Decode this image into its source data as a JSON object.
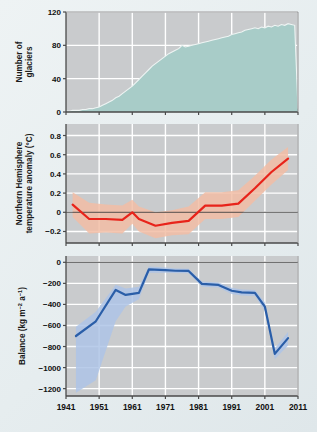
{
  "figure": {
    "background_color": "#e9eff1",
    "panel_color": "#c9cbcd",
    "grid_color": "#ffffff",
    "axis_color": "#4a4a4a"
  },
  "chart_data": [
    {
      "type": "area",
      "panel": "top",
      "title": "",
      "xlabel": "",
      "ylabel": "Number of glaciers",
      "ylabel_lines": [
        "Number of",
        "glaciers"
      ],
      "series_name": "Number of glaciers",
      "color": "#a8ccc8",
      "line_color": "#eef4f3",
      "xlim": [
        1941,
        2011
      ],
      "ylim": [
        0,
        120
      ],
      "yticks": [
        0,
        40,
        80,
        120
      ],
      "ytick_labels": [
        "0",
        "40",
        "80",
        "120"
      ],
      "xticks": [
        1941,
        1951,
        1961,
        1971,
        1981,
        1991,
        2001,
        2011
      ],
      "grid": true,
      "x": [
        1941,
        1942,
        1943,
        1944,
        1945,
        1946,
        1947,
        1948,
        1949,
        1950,
        1951,
        1952,
        1953,
        1954,
        1955,
        1956,
        1957,
        1958,
        1959,
        1960,
        1961,
        1962,
        1963,
        1964,
        1965,
        1966,
        1967,
        1968,
        1969,
        1970,
        1971,
        1972,
        1973,
        1974,
        1975,
        1976,
        1977,
        1978,
        1979,
        1980,
        1981,
        1982,
        1983,
        1984,
        1985,
        1986,
        1987,
        1988,
        1989,
        1990,
        1991,
        1992,
        1993,
        1994,
        1995,
        1996,
        1997,
        1998,
        1999,
        2000,
        2001,
        2002,
        2003,
        2004,
        2005,
        2006,
        2007,
        2008,
        2009,
        2010,
        2011
      ],
      "values": [
        1,
        1,
        2,
        2,
        2,
        3,
        3,
        4,
        4,
        5,
        6,
        8,
        10,
        12,
        14,
        17,
        19,
        22,
        25,
        28,
        31,
        35,
        39,
        43,
        47,
        51,
        55,
        58,
        61,
        64,
        67,
        70,
        72,
        74,
        76,
        80,
        78,
        79,
        80,
        81,
        82,
        83,
        84,
        85,
        86,
        87,
        88,
        89,
        90,
        91,
        93,
        94,
        95,
        96,
        98,
        99,
        100,
        101,
        100,
        102,
        101,
        103,
        102,
        104,
        103,
        105,
        104,
        106,
        105,
        104,
        4
      ]
    },
    {
      "type": "line",
      "panel": "middle",
      "title": "",
      "xlabel": "",
      "ylabel": "Northern Hemisphere temperature anomaly (°C)",
      "ylabel_lines": [
        "Northern Hemisphere",
        "temperature anomaly (°C)"
      ],
      "series_name": "Northern Hemisphere temperature anomaly",
      "color": "#e8231a",
      "band_color": "#f2bda4",
      "band_label": "uncertainty range",
      "units": "°C",
      "xlim": [
        1941,
        2011
      ],
      "ylim": [
        -0.32,
        0.92
      ],
      "yticks": [
        -0.2,
        0,
        0.2,
        0.4,
        0.6,
        0.8
      ],
      "ytick_labels": [
        "−0.2",
        "0",
        "0.2",
        "0.4",
        "0.6",
        "0.8"
      ],
      "xticks": [
        1941,
        1951,
        1961,
        1971,
        1981,
        1991,
        2001,
        2011
      ],
      "grid": true,
      "zero_line": 0,
      "x": [
        1943,
        1948,
        1953,
        1958,
        1961,
        1963,
        1968,
        1973,
        1978,
        1983,
        1988,
        1993,
        1998,
        2003,
        2008
      ],
      "values": [
        0.08,
        -0.07,
        -0.07,
        -0.08,
        0.0,
        -0.07,
        -0.14,
        -0.11,
        -0.09,
        0.07,
        0.07,
        0.09,
        0.25,
        0.42,
        0.56
      ],
      "band_upper": [
        0.21,
        0.1,
        0.08,
        0.07,
        0.13,
        0.06,
        0.0,
        0.02,
        0.06,
        0.21,
        0.21,
        0.23,
        0.38,
        0.55,
        0.68
      ],
      "band_lower": [
        -0.05,
        -0.22,
        -0.21,
        -0.22,
        -0.12,
        -0.2,
        -0.27,
        -0.24,
        -0.23,
        -0.07,
        -0.07,
        -0.05,
        0.12,
        0.29,
        0.44
      ]
    },
    {
      "type": "line",
      "panel": "bottom",
      "title": "",
      "xlabel": "",
      "ylabel": "Balance (kg m−2 a−1)",
      "ylabel_parts": [
        "Balance (kg m",
        "−2",
        " a",
        "−1",
        ")"
      ],
      "series_name": "Glacier mass balance",
      "color": "#2a5ea8",
      "band_color": "#aec4e6",
      "band_label": "uncertainty range",
      "units": "kg m−2 a−1",
      "xlim": [
        1941,
        2011
      ],
      "ylim": [
        -1270,
        60
      ],
      "yticks": [
        0,
        -200,
        -400,
        -600,
        -800,
        -1000,
        -1200
      ],
      "ytick_labels": [
        "0",
        "−200",
        "−400",
        "−600",
        "−800",
        "−1000",
        "−1200"
      ],
      "xticks": [
        1941,
        1951,
        1961,
        1971,
        1981,
        1991,
        2001,
        2011
      ],
      "grid": true,
      "zero_line": 0,
      "x": [
        1944,
        1950,
        1956,
        1959,
        1963,
        1966,
        1971,
        1974,
        1978,
        1982,
        1987,
        1991,
        1994,
        1998,
        2001,
        2004,
        2008
      ],
      "values": [
        -700,
        -560,
        -262,
        -310,
        -290,
        -68,
        -75,
        -80,
        -82,
        -205,
        -215,
        -270,
        -285,
        -290,
        -420,
        -870,
        -720
      ],
      "band_upper": [
        -612,
        -470,
        -212,
        -248,
        -232,
        -40,
        -50,
        -58,
        -60,
        -182,
        -192,
        -242,
        -258,
        -262,
        -380,
        -818,
        -660
      ],
      "band_lower": [
        -1240,
        -1120,
        -560,
        -420,
        -350,
        -100,
        -100,
        -102,
        -105,
        -232,
        -240,
        -300,
        -315,
        -320,
        -462,
        -920,
        -790
      ]
    }
  ]
}
